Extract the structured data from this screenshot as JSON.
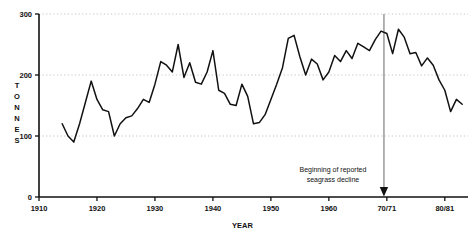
{
  "chart_data": {
    "type": "line",
    "title": "",
    "xlabel": "YEAR",
    "ylabel": "TONNES",
    "ylabel_letters": [
      "T",
      "O",
      "N",
      "N",
      "E",
      "S"
    ],
    "xlim": [
      1910,
      1984
    ],
    "ylim": [
      0,
      300
    ],
    "grid": "horizontal-dotted",
    "legend": "none",
    "y_ticks": [
      "0",
      "100",
      "200",
      "300"
    ],
    "y_tick_values": [
      0,
      100,
      200,
      300
    ],
    "x_ticks": [
      "1910",
      "1920",
      "1930",
      "1940",
      "1950",
      "1960",
      "70/71",
      "80/81"
    ],
    "x_tick_values": [
      1910,
      1920,
      1930,
      1940,
      1950,
      1960,
      1970,
      1980
    ],
    "line_color": "#111111",
    "annotation_color": "#8a8a8a",
    "annotations": [
      {
        "text_line1": "Beginning of reported",
        "text_line2": "seagrass decline",
        "x_value": 1969.5,
        "marker": "down-arrow"
      }
    ],
    "series": [
      {
        "name": "Catch",
        "x": [
          1914,
          1915,
          1916,
          1917,
          1918,
          1919,
          1920,
          1921,
          1922,
          1923,
          1924,
          1925,
          1926,
          1927,
          1928,
          1929,
          1930,
          1931,
          1932,
          1933,
          1934,
          1935,
          1936,
          1937,
          1938,
          1939,
          1940,
          1941,
          1942,
          1943,
          1944,
          1945,
          1946,
          1947,
          1948,
          1949,
          1950,
          1951,
          1952,
          1953,
          1954,
          1955,
          1956,
          1957,
          1958,
          1959,
          1960,
          1961,
          1962,
          1963,
          1964,
          1965,
          1966,
          1967,
          1968,
          1969,
          1970,
          1971,
          1972,
          1973,
          1974,
          1975,
          1976,
          1977,
          1978,
          1979,
          1980,
          1981,
          1982,
          1983
        ],
        "values": [
          120,
          100,
          90,
          120,
          155,
          190,
          160,
          143,
          140,
          100,
          120,
          130,
          133,
          145,
          160,
          155,
          185,
          222,
          216,
          205,
          250,
          196,
          220,
          188,
          185,
          205,
          240,
          175,
          170,
          152,
          150,
          185,
          165,
          120,
          122,
          135,
          160,
          185,
          212,
          260,
          265,
          230,
          200,
          226,
          218,
          192,
          205,
          232,
          222,
          240,
          227,
          252,
          246,
          240,
          258,
          272,
          268,
          235,
          275,
          262,
          235,
          237,
          215,
          228,
          216,
          192,
          175,
          140,
          160,
          152
        ]
      }
    ]
  },
  "axis": {
    "y_label_text": "TONNES",
    "x_label_text": "YEAR"
  }
}
